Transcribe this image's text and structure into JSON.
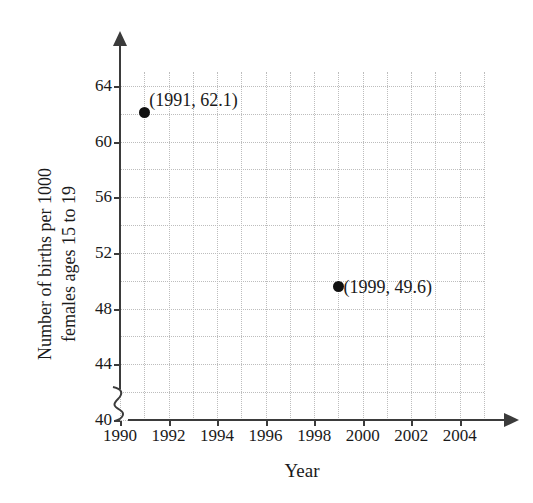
{
  "chart_data": {
    "type": "scatter",
    "title": "",
    "xlabel": "Year",
    "ylabel": "Number of births per 1000 females ages 15 to 19",
    "ylabel_lines": [
      "Number of births per 1000",
      "females ages 15 to 19"
    ],
    "xlim": [
      1990,
      2005
    ],
    "ylim": [
      40,
      65
    ],
    "x_ticks": [
      1990,
      1992,
      1994,
      1996,
      1998,
      2000,
      2002,
      2004
    ],
    "x_tick_labels": [
      "1990",
      "1992",
      "1994",
      "1996",
      "1998",
      "2000",
      "2002",
      "2004"
    ],
    "y_ticks": [
      40,
      44,
      48,
      52,
      56,
      60,
      64
    ],
    "y_tick_labels": [
      "40",
      "44",
      "48",
      "52",
      "56",
      "60",
      "64"
    ],
    "x_gridline_step": 1,
    "y_gridline_step": 2,
    "grid": true,
    "grid_style": "dotted",
    "grid_color": "#bdbdbd",
    "legend": "none",
    "axis_break": "y-axis origin break",
    "point_color": "#111111",
    "axis_color": "#3b3b3b",
    "background_color": "#ffffff",
    "x": [
      1991,
      1999
    ],
    "y": [
      62.1,
      49.6
    ],
    "points": [
      {
        "x": 1991,
        "y": 62.1,
        "label": "(1991, 62.1)"
      },
      {
        "x": 1999,
        "y": 49.6,
        "label": "(1999, 49.6)"
      }
    ]
  }
}
